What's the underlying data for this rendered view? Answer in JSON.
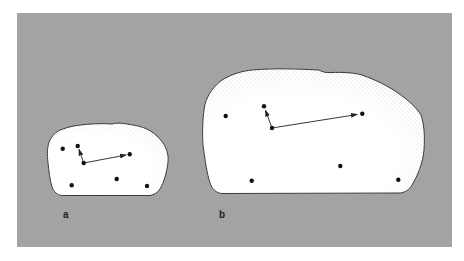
{
  "figure": {
    "background_color": "#a4a4a4",
    "blob_fill": "#ffffff",
    "outline_color": "#3a3a3a",
    "dot_color": "#111111",
    "arrow_color": "#222222",
    "panels": [
      {
        "label": "a",
        "label_pos": [
          66,
          218
        ],
        "dots": [
          [
            62.7,
            148.7
          ],
          [
            77.7,
            146
          ],
          [
            83.7,
            163
          ],
          [
            129.7,
            154.3
          ],
          [
            71.7,
            185.3
          ],
          [
            116.7,
            179
          ],
          [
            147,
            186
          ]
        ],
        "arrows": [
          {
            "from": [
              83.7,
              163
            ],
            "to": [
              79,
              149.5
            ]
          },
          {
            "from": [
              83.7,
              163
            ],
            "to": [
              126,
              155
            ]
          }
        ]
      },
      {
        "label": "b",
        "label_pos": [
          220,
          218
        ],
        "dots": [
          [
            225.7,
            116
          ],
          [
            264,
            106.3
          ],
          [
            272,
            128
          ],
          [
            362.3,
            113.7
          ],
          [
            251.7,
            180.7
          ],
          [
            340.3,
            166
          ],
          [
            398.3,
            179.7
          ]
        ],
        "arrows": [
          {
            "from": [
              272,
              128
            ],
            "to": [
              265.5,
              110.5
            ]
          },
          {
            "from": [
              272,
              128
            ],
            "to": [
              357,
              114.5
            ]
          }
        ]
      }
    ]
  }
}
